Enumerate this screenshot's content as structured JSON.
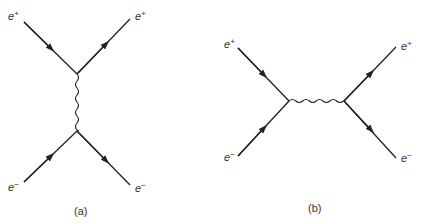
{
  "diagrams": [
    {
      "id": "a",
      "caption": "(a)",
      "description": "t-channel photon exchange (Bhabha scattering)",
      "particles": [
        {
          "name": "e",
          "charge": "+",
          "position": "top-left",
          "direction": "incoming"
        },
        {
          "name": "e",
          "charge": "+",
          "position": "top-right",
          "direction": "outgoing"
        },
        {
          "name": "e",
          "charge": "−",
          "position": "bottom-left",
          "direction": "incoming"
        },
        {
          "name": "e",
          "charge": "−",
          "position": "bottom-right",
          "direction": "outgoing"
        }
      ],
      "propagator": "vertical wavy line (photon)"
    },
    {
      "id": "b",
      "caption": "(b)",
      "description": "s-channel annihilation (Bhabha scattering)",
      "particles": [
        {
          "name": "e",
          "charge": "+",
          "position": "top-left",
          "direction": "incoming"
        },
        {
          "name": "e",
          "charge": "−",
          "position": "bottom-left",
          "direction": "incoming"
        },
        {
          "name": "e",
          "charge": "+",
          "position": "top-right",
          "direction": "outgoing"
        },
        {
          "name": "e",
          "charge": "−",
          "position": "bottom-right",
          "direction": "outgoing"
        }
      ],
      "propagator": "horizontal wavy line (photon)"
    }
  ],
  "labels": {
    "e": "e",
    "plus": "+",
    "minus": "−",
    "caption_a": "(a)",
    "caption_b": "(b)"
  }
}
